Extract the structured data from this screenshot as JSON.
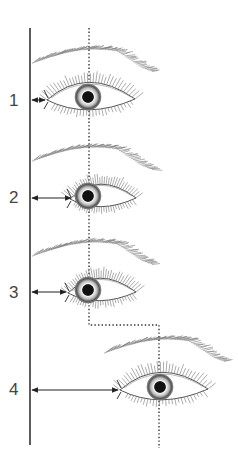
{
  "diagram": {
    "colors": {
      "line": "#333333",
      "dotted": "#333333",
      "sketch": "#666666",
      "iris_ring": "#555555",
      "pupil": "#111111",
      "background": "#ffffff"
    },
    "reference_line": {
      "x": 30,
      "y1": 28,
      "y2": 445
    },
    "dotted_path": [
      [
        89,
        28
      ],
      [
        89,
        325
      ],
      [
        159,
        325
      ],
      [
        159,
        448
      ]
    ],
    "eyes": [
      {
        "label": "1",
        "label_x": 9,
        "label_y": 106,
        "cx": 88,
        "cy": 97,
        "inner_x": 47,
        "outer_x": 135,
        "open": 22,
        "iris_r": 13,
        "arrow_y": 100,
        "arrow_to": 45,
        "brow_y": 52,
        "brow_x1": 32,
        "brow_x2": 152
      },
      {
        "label": "2",
        "label_x": 9,
        "label_y": 203,
        "cx": 88,
        "cy": 196,
        "inner_x": 70,
        "outer_x": 136,
        "open": 18,
        "iris_r": 13,
        "arrow_y": 198,
        "arrow_to": 71,
        "brow_y": 150,
        "brow_x1": 32,
        "brow_x2": 152
      },
      {
        "label": "3",
        "label_x": 9,
        "label_y": 298,
        "cx": 88,
        "cy": 290,
        "inner_x": 68,
        "outer_x": 136,
        "open": 18,
        "iris_r": 13,
        "arrow_y": 292,
        "arrow_to": 66,
        "brow_y": 245,
        "brow_x1": 32,
        "brow_x2": 152
      },
      {
        "label": "4",
        "label_x": 9,
        "label_y": 395,
        "cx": 160,
        "cy": 387,
        "inner_x": 120,
        "outer_x": 208,
        "open": 22,
        "iris_r": 13,
        "arrow_y": 390,
        "arrow_to": 118,
        "brow_y": 342,
        "brow_x1": 104,
        "brow_x2": 224
      }
    ]
  }
}
